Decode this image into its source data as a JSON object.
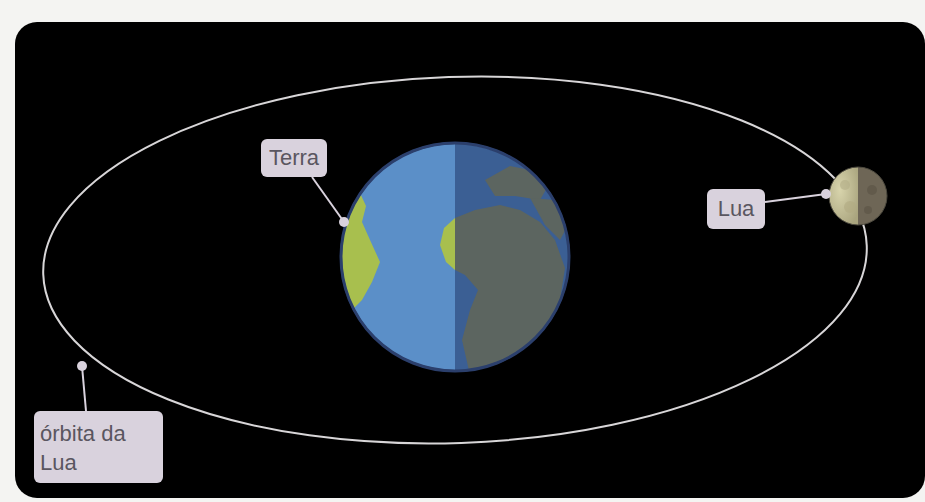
{
  "diagram": {
    "labels": {
      "terra": "Terra",
      "lua": "Lua",
      "orbita_line1": "órbita da",
      "orbita_line2": "Lua"
    },
    "colors": {
      "background": "#000000",
      "page": "#f4f4f2",
      "orbit": "#d8d6d8",
      "label_bg": "#d9d2dd",
      "label_text": "#5a5660",
      "ocean_day": "#5b8fc8",
      "ocean_night": "#3b5f94",
      "land_day": "#a8bf4e",
      "land_night": "#5c6560",
      "moon_day": "#c8c49c",
      "moon_night": "#6e6656"
    },
    "icons": {
      "earth": "earth-icon",
      "moon": "moon-icon"
    }
  }
}
